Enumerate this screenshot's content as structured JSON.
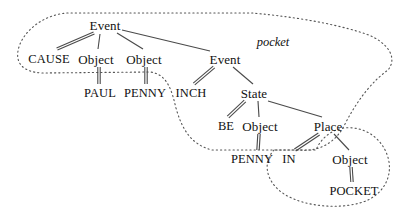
{
  "figure": {
    "kind": "conceptual-structure-tree",
    "background_color": "#ffffff",
    "line_color": "#4a4a4a",
    "text_color": "#111111",
    "dotted_color": "#555555"
  },
  "region_labels": [
    {
      "id": "pocket",
      "text": "pocket",
      "x": 273,
      "y": 42
    }
  ],
  "nodes": [
    {
      "id": "event1",
      "text": "Event",
      "x": 105,
      "y": 25,
      "style": "mixed"
    },
    {
      "id": "cause",
      "text": "CAUSE",
      "x": 49,
      "y": 59,
      "style": "caps"
    },
    {
      "id": "object1",
      "text": "Object",
      "x": 96,
      "y": 59,
      "style": "mixed"
    },
    {
      "id": "object2",
      "text": "Object",
      "x": 144,
      "y": 59,
      "style": "mixed"
    },
    {
      "id": "paul",
      "text": "PAUL",
      "x": 100,
      "y": 93,
      "style": "caps"
    },
    {
      "id": "penny1",
      "text": "PENNY",
      "x": 145,
      "y": 93,
      "style": "caps"
    },
    {
      "id": "event2",
      "text": "Event",
      "x": 225,
      "y": 59,
      "style": "mixed"
    },
    {
      "id": "inch",
      "text": "INCH",
      "x": 191,
      "y": 93,
      "style": "caps"
    },
    {
      "id": "state",
      "text": "State",
      "x": 254,
      "y": 93,
      "style": "mixed"
    },
    {
      "id": "be",
      "text": "BE",
      "x": 226,
      "y": 126,
      "style": "caps"
    },
    {
      "id": "object3",
      "text": "Object",
      "x": 260,
      "y": 126,
      "style": "mixed"
    },
    {
      "id": "place",
      "text": "Place",
      "x": 328,
      "y": 126,
      "style": "mixed"
    },
    {
      "id": "penny2",
      "text": "PENNY",
      "x": 252,
      "y": 159,
      "style": "caps"
    },
    {
      "id": "in",
      "text": "IN",
      "x": 289,
      "y": 159,
      "style": "caps"
    },
    {
      "id": "object4",
      "text": "Object",
      "x": 350,
      "y": 159,
      "style": "mixed"
    },
    {
      "id": "pocket",
      "text": "POCKET",
      "x": 354,
      "y": 191,
      "style": "caps"
    }
  ],
  "edges": [
    {
      "from": "event1",
      "to": "cause",
      "type": "double",
      "x1": 94,
      "y1": 33,
      "x2": 57,
      "y2": 49
    },
    {
      "from": "event1",
      "to": "object1",
      "type": "single",
      "x1": 100,
      "y1": 34,
      "x2": 98,
      "y2": 49
    },
    {
      "from": "event1",
      "to": "object2",
      "type": "single",
      "x1": 117,
      "y1": 33,
      "x2": 143,
      "y2": 49
    },
    {
      "from": "event1",
      "to": "event2",
      "type": "single",
      "x1": 122,
      "y1": 30,
      "x2": 210,
      "y2": 51
    },
    {
      "from": "object1",
      "to": "paul",
      "type": "double",
      "x1": 99,
      "y1": 67,
      "x2": 99,
      "y2": 84
    },
    {
      "from": "object2",
      "to": "penny1",
      "type": "double",
      "x1": 146,
      "y1": 67,
      "x2": 146,
      "y2": 84
    },
    {
      "from": "event2",
      "to": "inch",
      "type": "double",
      "x1": 214,
      "y1": 67,
      "x2": 194,
      "y2": 84
    },
    {
      "from": "event2",
      "to": "state",
      "type": "single",
      "x1": 233,
      "y1": 67,
      "x2": 253,
      "y2": 84
    },
    {
      "from": "state",
      "to": "be",
      "type": "double",
      "x1": 245,
      "y1": 101,
      "x2": 228,
      "y2": 117
    },
    {
      "from": "state",
      "to": "object3",
      "type": "single",
      "x1": 258,
      "y1": 101,
      "x2": 259,
      "y2": 117
    },
    {
      "from": "state",
      "to": "place",
      "type": "single",
      "x1": 268,
      "y1": 101,
      "x2": 322,
      "y2": 117
    },
    {
      "from": "object3",
      "to": "penny2",
      "type": "double",
      "x1": 259,
      "y1": 134,
      "x2": 258,
      "y2": 150
    },
    {
      "from": "place",
      "to": "in",
      "type": "double",
      "x1": 319,
      "y1": 134,
      "x2": 295,
      "y2": 150
    },
    {
      "from": "place",
      "to": "object4",
      "type": "single",
      "x1": 334,
      "y1": 134,
      "x2": 349,
      "y2": 150
    },
    {
      "from": "object4",
      "to": "pocket",
      "type": "double",
      "x1": 351,
      "y1": 167,
      "x2": 352,
      "y2": 182
    }
  ],
  "dotted_regions": [
    {
      "id": "outer-pocket-region",
      "label": "pocket",
      "path": "M 68 13 C 48 14 28 26 20 44 C 13 62 22 72 42 73 L 150 72 C 168 74 172 92 176 108 C 182 130 192 145 212 150 L 300 150 C 322 152 338 140 346 122 C 360 96 374 80 388 70 C 398 58 388 42 366 34 C 330 22 286 16 252 13 Z"
    },
    {
      "id": "inner-in-pocket-region",
      "path": "M 274 150 C 262 163 266 182 284 194 C 306 208 346 210 368 200 C 388 190 394 170 386 152 C 378 134 360 126 344 128 C 330 130 320 140 316 150 Z"
    }
  ]
}
